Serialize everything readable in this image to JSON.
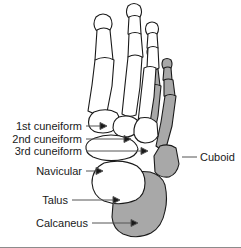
{
  "figure": {
    "background_color": "#ffffff",
    "bone_fill_light": "#ffffff",
    "bone_fill_shaded": "#a8a8a8",
    "outline_color": "#1a1a1a",
    "leader_color": "#555555",
    "text_color": "#1a1a1a"
  },
  "labels": {
    "cuneiform_1": "1st cuneiform",
    "cuneiform_2": "2nd cuneiform",
    "cuneiform_3": "3rd cuneiform",
    "navicular": "Navicular",
    "talus": "Talus",
    "calcaneus": "Calcaneus",
    "cuboid": "Cuboid"
  },
  "anatomy": {
    "shaded_bones": [
      "4th metatarsal",
      "5th metatarsal",
      "4th toe phalanges",
      "5th toe phalanges",
      "cuboid",
      "calcaneus"
    ],
    "unshaded_bones": [
      "1st cuneiform",
      "2nd cuneiform",
      "3rd cuneiform",
      "navicular",
      "talus",
      "1st metatarsal",
      "2nd metatarsal",
      "3rd metatarsal"
    ]
  }
}
